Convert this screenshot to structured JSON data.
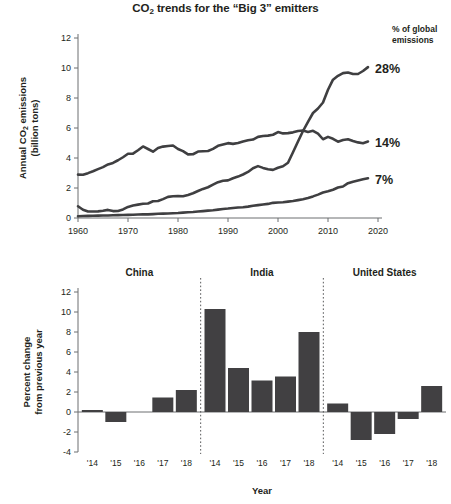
{
  "title": {
    "pre": "CO",
    "sub": "2",
    "post": " trends for the “Big 3” emitters"
  },
  "colors": {
    "line": "#3f3f41",
    "bar": "#414042",
    "axis": "#6d6e71",
    "text": "#231f20"
  },
  "chart_data": [
    {
      "type": "line",
      "title": "CO2 trends for the “Big 3” emitters",
      "xlabel": "",
      "ylabel": "Annual CO2 emissions (billion tons)",
      "ylabel_line1": "Annual CO",
      "ylabel_line1_sub": "2",
      "ylabel_line1_rest": " emissions",
      "ylabel_line2": "(billion tons)",
      "xlim": [
        1960,
        2020
      ],
      "ylim": [
        0,
        12
      ],
      "xticks": [
        1960,
        1970,
        1980,
        1990,
        2000,
        2010,
        2020
      ],
      "xticklabels": [
        "1960",
        "1970",
        "1980",
        "1990",
        "2000",
        "2010",
        "2020"
      ],
      "yticks": [
        0,
        2,
        4,
        6,
        8,
        10,
        12
      ],
      "yticklabels": [
        "0",
        "2",
        "4",
        "6",
        "8",
        "10",
        "12"
      ],
      "grid": false,
      "legend_header_line1": "% of global",
      "legend_header_line2": "emissions",
      "annotations": [
        {
          "name": "china-share",
          "text": "28%",
          "year": 2018,
          "value": 10.0
        },
        {
          "name": "united-states-share",
          "text": "14%",
          "year": 2018,
          "value": 5.1
        },
        {
          "name": "india-share",
          "text": "7%",
          "year": 2018,
          "value": 2.6
        }
      ],
      "series": [
        {
          "name": "United States",
          "share_label": "14%",
          "x": [
            1960,
            1961,
            1962,
            1963,
            1964,
            1965,
            1966,
            1967,
            1968,
            1969,
            1970,
            1971,
            1972,
            1973,
            1974,
            1975,
            1976,
            1977,
            1978,
            1979,
            1980,
            1981,
            1982,
            1983,
            1984,
            1985,
            1986,
            1987,
            1988,
            1989,
            1990,
            1991,
            1992,
            1993,
            1994,
            1995,
            1996,
            1997,
            1998,
            1999,
            2000,
            2001,
            2002,
            2003,
            2004,
            2005,
            2006,
            2007,
            2008,
            2009,
            2010,
            2011,
            2012,
            2013,
            2014,
            2015,
            2016,
            2017,
            2018
          ],
          "values": [
            2.89,
            2.88,
            2.99,
            3.12,
            3.26,
            3.39,
            3.57,
            3.67,
            3.85,
            4.05,
            4.28,
            4.29,
            4.52,
            4.77,
            4.6,
            4.42,
            4.67,
            4.76,
            4.8,
            4.83,
            4.6,
            4.46,
            4.24,
            4.25,
            4.43,
            4.45,
            4.47,
            4.61,
            4.81,
            4.9,
            4.99,
            4.94,
            5.0,
            5.1,
            5.18,
            5.23,
            5.41,
            5.47,
            5.49,
            5.55,
            5.73,
            5.64,
            5.66,
            5.71,
            5.8,
            5.83,
            5.74,
            5.81,
            5.62,
            5.25,
            5.41,
            5.28,
            5.09,
            5.2,
            5.25,
            5.13,
            5.04,
            4.98,
            5.1
          ]
        },
        {
          "name": "China",
          "share_label": "28%",
          "x": [
            1960,
            1961,
            1962,
            1963,
            1964,
            1965,
            1966,
            1967,
            1968,
            1969,
            1970,
            1971,
            1972,
            1973,
            1974,
            1975,
            1976,
            1977,
            1978,
            1979,
            1980,
            1981,
            1982,
            1983,
            1984,
            1985,
            1986,
            1987,
            1988,
            1989,
            1990,
            1991,
            1992,
            1993,
            1994,
            1995,
            1996,
            1997,
            1998,
            1999,
            2000,
            2001,
            2002,
            2003,
            2004,
            2005,
            2006,
            2007,
            2008,
            2009,
            2010,
            2011,
            2012,
            2013,
            2014,
            2015,
            2016,
            2017,
            2018
          ],
          "values": [
            0.78,
            0.55,
            0.43,
            0.43,
            0.44,
            0.48,
            0.54,
            0.46,
            0.47,
            0.57,
            0.74,
            0.83,
            0.89,
            0.95,
            0.97,
            1.12,
            1.13,
            1.26,
            1.41,
            1.45,
            1.47,
            1.45,
            1.54,
            1.65,
            1.8,
            1.94,
            2.05,
            2.22,
            2.39,
            2.48,
            2.51,
            2.65,
            2.76,
            2.9,
            3.07,
            3.32,
            3.46,
            3.34,
            3.25,
            3.21,
            3.35,
            3.45,
            3.68,
            4.38,
            5.1,
            5.8,
            6.41,
            7.0,
            7.3,
            7.7,
            8.55,
            9.22,
            9.48,
            9.66,
            9.7,
            9.6,
            9.6,
            9.8,
            10.06
          ]
        },
        {
          "name": "India",
          "share_label": "7%",
          "x": [
            1960,
            1961,
            1962,
            1963,
            1964,
            1965,
            1966,
            1967,
            1968,
            1969,
            1970,
            1971,
            1972,
            1973,
            1974,
            1975,
            1976,
            1977,
            1978,
            1979,
            1980,
            1981,
            1982,
            1983,
            1984,
            1985,
            1986,
            1987,
            1988,
            1989,
            1990,
            1991,
            1992,
            1993,
            1994,
            1995,
            1996,
            1997,
            1998,
            1999,
            2000,
            2001,
            2002,
            2003,
            2004,
            2005,
            2006,
            2007,
            2008,
            2009,
            2010,
            2011,
            2012,
            2013,
            2014,
            2015,
            2016,
            2017,
            2018
          ],
          "values": [
            0.12,
            0.13,
            0.14,
            0.15,
            0.16,
            0.17,
            0.17,
            0.18,
            0.19,
            0.2,
            0.21,
            0.22,
            0.23,
            0.24,
            0.24,
            0.26,
            0.28,
            0.29,
            0.3,
            0.32,
            0.33,
            0.36,
            0.38,
            0.4,
            0.43,
            0.46,
            0.49,
            0.52,
            0.56,
            0.6,
            0.63,
            0.67,
            0.7,
            0.72,
            0.76,
            0.82,
            0.86,
            0.9,
            0.94,
            1.01,
            1.03,
            1.05,
            1.09,
            1.13,
            1.19,
            1.25,
            1.33,
            1.44,
            1.56,
            1.7,
            1.78,
            1.88,
            2.03,
            2.1,
            2.32,
            2.42,
            2.5,
            2.58,
            2.65
          ]
        }
      ]
    },
    {
      "type": "bar",
      "title": "",
      "xlabel": "Year",
      "ylabel": "Percent change from previous year",
      "ylabel_line1": "Percent change",
      "ylabel_line2": "from previous year",
      "ylim": [
        -4,
        12
      ],
      "yticks": [
        -4,
        -2,
        0,
        2,
        4,
        6,
        8,
        10,
        12
      ],
      "yticklabels": [
        "-4",
        "-2",
        "0",
        "2",
        "4",
        "6",
        "8",
        "10",
        "12"
      ],
      "grid": false,
      "panels": [
        {
          "name": "China",
          "categories": [
            "'14",
            "'15",
            "'16",
            "'17",
            "'18"
          ],
          "values": [
            0.2,
            -1.0,
            0.0,
            1.45,
            2.2
          ]
        },
        {
          "name": "India",
          "categories": [
            "'14",
            "'15",
            "'16",
            "'17",
            "'18"
          ],
          "values": [
            10.3,
            4.4,
            3.15,
            3.55,
            8.0
          ]
        },
        {
          "name": "United States",
          "categories": [
            "'14",
            "'15",
            "'16",
            "'17",
            "'18"
          ],
          "values": [
            0.85,
            -2.8,
            -2.2,
            -0.7,
            2.6
          ]
        }
      ]
    }
  ]
}
